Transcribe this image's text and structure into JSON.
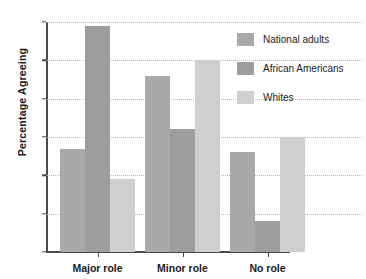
{
  "chart_data": {
    "type": "bar",
    "title": "",
    "subtitle": "",
    "xlabel": "",
    "ylabel": "Percentage Agreeing",
    "ylim": [
      0,
      60
    ],
    "yticks": [
      0,
      10,
      20,
      30,
      40,
      50,
      60
    ],
    "grid": true,
    "legend_position": "top-right",
    "categories": [
      "Major role",
      "Minor role",
      "No role"
    ],
    "series": [
      {
        "name": "National adults",
        "color": "#a9a9a9",
        "values": [
          27,
          46,
          26
        ]
      },
      {
        "name": "African Americans",
        "color": "#9d9d9d",
        "values": [
          59,
          32,
          8
        ]
      },
      {
        "name": "Whites",
        "color": "#cfcfcf",
        "values": [
          19,
          50,
          30
        ]
      }
    ]
  },
  "axes": {
    "y_title": "Percentage Agreeing",
    "y_tick_labels": [
      "0",
      "10",
      "20",
      "30",
      "40",
      "50",
      "60"
    ],
    "x_tick_labels": [
      "Major role",
      "Minor role",
      "No role"
    ]
  },
  "legend": {
    "entries": [
      {
        "label": "National adults",
        "color": "#a9a9a9"
      },
      {
        "label": "African Americans",
        "color": "#9d9d9d"
      },
      {
        "label": "Whites",
        "color": "#cfcfcf"
      }
    ]
  },
  "colors": {
    "axis": "#4a4a4a",
    "grid": "#b9b9b9",
    "text": "#1b1b1b",
    "background": "#ffffff"
  }
}
